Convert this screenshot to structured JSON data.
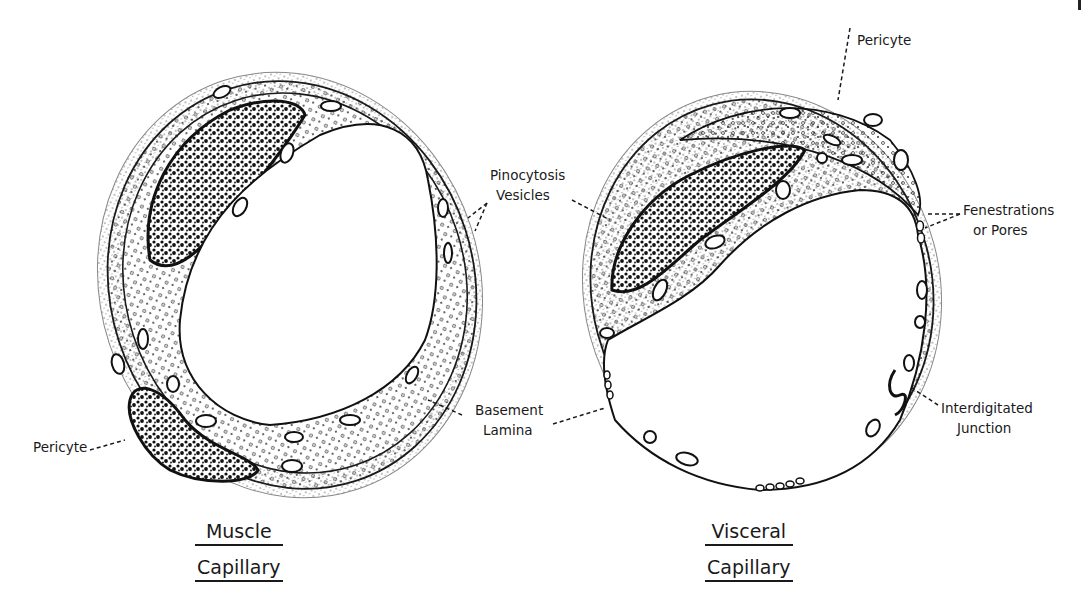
{
  "figure": {
    "page_mark": "/",
    "diagrams": [
      {
        "id": "muscle",
        "title_lines": [
          "Muscle",
          "Capillary"
        ]
      },
      {
        "id": "visceral",
        "title_lines": [
          "Visceral",
          "Capillary"
        ]
      }
    ],
    "labels": {
      "pericyte_left": "Pericyte",
      "pericyte_top": "Pericyte",
      "pinocytosis": [
        "Pinocytosis",
        "Vesicles"
      ],
      "basement": [
        "Basement",
        "Lamina"
      ],
      "fenestrations": [
        "Fenestrations",
        "or Pores"
      ],
      "interdigitated": [
        "Interdigitated",
        "Junction"
      ]
    },
    "colors": {
      "ink": "#1a1a1a",
      "stipple": "#6b6b6b",
      "background": "#ffffff"
    }
  }
}
